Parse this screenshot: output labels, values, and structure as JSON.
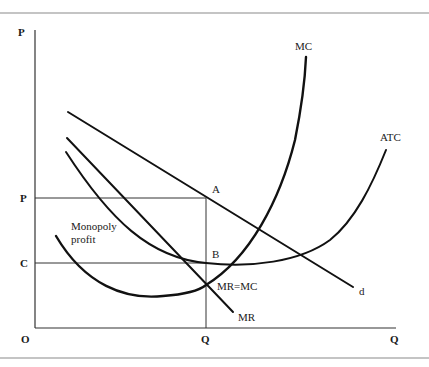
{
  "diagram": {
    "type": "monopoly-profit-cost-curves",
    "axes": {
      "y_label": "P",
      "x_label": "Q",
      "origin_label": "O"
    },
    "axis_ticks": {
      "y": [
        {
          "label": "P",
          "meaning": "monopoly price"
        },
        {
          "label": "C",
          "meaning": "average total cost at Q"
        }
      ],
      "x": [
        {
          "label": "Q",
          "meaning": "profit-maximizing quantity"
        }
      ]
    },
    "curves": [
      {
        "id": "MC",
        "label": "MC",
        "description": "Marginal cost, U-shaped, steeply rising"
      },
      {
        "id": "ATC",
        "label": "ATC",
        "description": "Average total cost, U-shaped"
      },
      {
        "id": "d",
        "label": "d",
        "description": "Demand curve, downward sloping"
      },
      {
        "id": "MR",
        "label": "MR",
        "description": "Marginal revenue, steeper downward slope"
      }
    ],
    "points": [
      {
        "label": "A",
        "description": "Price on demand curve at Q"
      },
      {
        "label": "B",
        "description": "ATC at Q"
      },
      {
        "label": "MR=MC",
        "description": "Intersection of MR and MC"
      }
    ],
    "regions": [
      {
        "label": "Monopoly profit",
        "line1": "Monopoly",
        "line2": "profit",
        "description": "Rectangle between P and C up to Q"
      }
    ]
  }
}
